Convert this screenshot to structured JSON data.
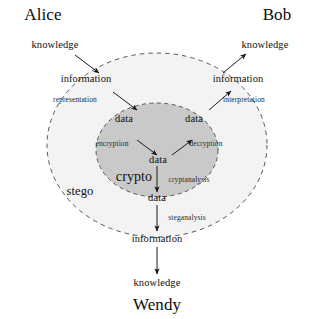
{
  "diagram": {
    "title_hidden": "Alice-Bob-Wendy steganography and cryptography model",
    "actors": {
      "alice": "Alice",
      "bob": "Bob",
      "wendy": "Wendy"
    },
    "regions": {
      "stego": "stego",
      "crypto": "crypto"
    },
    "nodes": {
      "alice_knowledge": "knowledge",
      "bob_knowledge": "knowledge",
      "wendy_knowledge": "knowledge",
      "alice_information": "information",
      "bob_information": "information",
      "wendy_information": "information",
      "alice_data": "data",
      "bob_data": "data",
      "center_data": "data",
      "bottom_data": "data"
    },
    "edges": {
      "representation": "representation",
      "interpretation": "interpretation",
      "encryption": "encryption",
      "decryption": "decryption",
      "cryptanalysis": "cryptanalysis",
      "steganalysis": "steganalysis"
    },
    "colors": {
      "background": "#ffffff",
      "text": "#111111",
      "outer_fill": "#f2f2f2",
      "inner_fill": "#c9c9c9",
      "dash_stroke": "#4a4a4a",
      "arrow_stroke": "#1a1a1a"
    }
  }
}
